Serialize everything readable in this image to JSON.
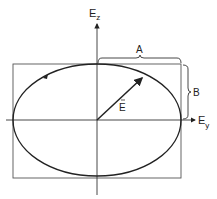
{
  "diagram": {
    "axes": {
      "vertical_label_main": "E",
      "vertical_label_sub": "z",
      "horizontal_label_main": "E",
      "horizontal_label_sub": "y"
    },
    "vector": {
      "label": "E",
      "accent": "→"
    },
    "braces": {
      "horizontal_label": "A",
      "vertical_label": "B"
    },
    "colors": {
      "stroke": "#222222",
      "box": "#555555",
      "background": "#ffffff"
    }
  }
}
